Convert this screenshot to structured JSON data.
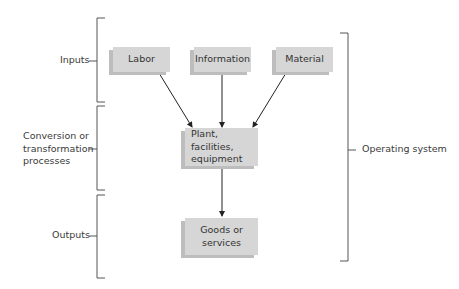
{
  "diagram": {
    "type": "flow",
    "stages": [
      {
        "id": "inputs",
        "label": "Inputs"
      },
      {
        "id": "conversion",
        "label_lines": [
          "Conversion or",
          "transformation",
          "processes"
        ]
      },
      {
        "id": "outputs",
        "label": "Outputs"
      }
    ],
    "system_label": "Operating system",
    "nodes": {
      "labor": "Labor",
      "information": "Information",
      "material": "Material",
      "plant_lines": [
        "Plant, facilities,",
        "equipment"
      ],
      "goods_lines": [
        "Goods or",
        "services"
      ]
    },
    "edges": [
      {
        "from": "labor",
        "to": "plant"
      },
      {
        "from": "information",
        "to": "plant"
      },
      {
        "from": "material",
        "to": "plant"
      },
      {
        "from": "plant",
        "to": "goods"
      }
    ],
    "colors": {
      "box_fill": "#d6d6d6",
      "box_shadow": "#bdbdbd",
      "line": "#555555"
    }
  }
}
